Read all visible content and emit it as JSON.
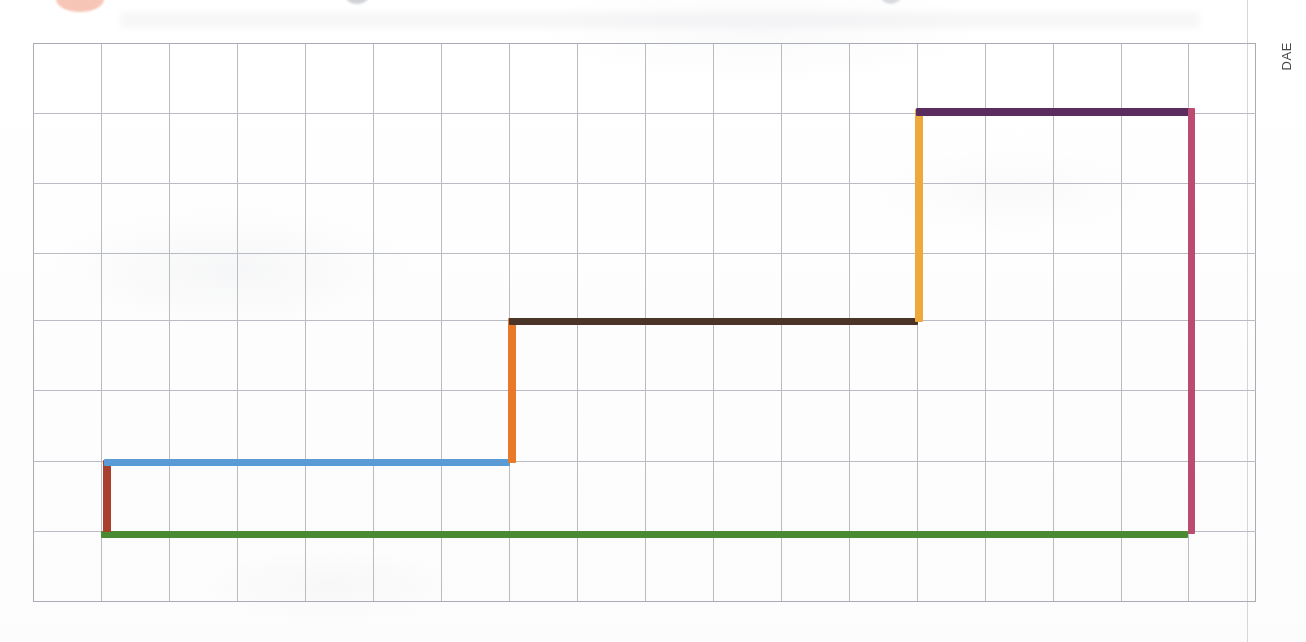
{
  "page": {
    "side_label": "DAE",
    "background_color": "#fefefe",
    "grid_color": "#b9bcc2"
  },
  "chart_data": {
    "type": "line",
    "subtype": "step-chart-hand-drawn",
    "title": "",
    "subtitle": "",
    "xlabel": "",
    "ylabel": "",
    "grid": true,
    "grid_columns": 18,
    "grid_rows": 8,
    "xlim": [
      0,
      18
    ],
    "ylim": [
      0,
      8
    ],
    "legend": "none",
    "annotations": [
      "DAE"
    ],
    "axis_note": "Axes are unlabeled; values are read as grid-square units from the lower-left corner of the printed grid.",
    "series": [
      {
        "name": "baseline",
        "color": "#4A8A33",
        "color_name": "green",
        "orientation": "horizontal",
        "y_units": 1.0,
        "x_start_units": 1.0,
        "x_end_units": 17.0,
        "thickness_px": 7,
        "px": {
          "x1": 101,
          "x2": 1188,
          "y": 531
        }
      },
      {
        "name": "riser-1",
        "color": "#A8402D",
        "color_name": "dark red",
        "orientation": "vertical",
        "x_units": 1.0,
        "y_start_units": 1.0,
        "y_end_units": 2.0,
        "thickness_px": 8,
        "px": {
          "x": 103,
          "y1": 460,
          "y2": 532
        }
      },
      {
        "name": "step-1",
        "color": "#5B9BD5",
        "color_name": "blue",
        "orientation": "horizontal",
        "y_units": 2.0,
        "x_start_units": 1.0,
        "x_end_units": 7.0,
        "thickness_px": 7,
        "px": {
          "x1": 104,
          "x2": 510,
          "y": 459
        }
      },
      {
        "name": "riser-2",
        "color": "#E8792B",
        "color_name": "orange",
        "orientation": "vertical",
        "x_units": 7.0,
        "y_start_units": 2.0,
        "y_end_units": 4.0,
        "thickness_px": 8,
        "px": {
          "x": 508,
          "y1": 318,
          "y2": 463
        }
      },
      {
        "name": "step-2",
        "color": "#4A3528",
        "color_name": "brown",
        "orientation": "horizontal",
        "y_units": 4.0,
        "x_start_units": 7.0,
        "x_end_units": 13.0,
        "thickness_px": 7,
        "px": {
          "x1": 509,
          "x2": 918,
          "y": 318
        }
      },
      {
        "name": "riser-3",
        "color": "#EFA83A",
        "color_name": "amber",
        "orientation": "vertical",
        "x_units": 13.0,
        "y_start_units": 4.0,
        "y_end_units": 7.0,
        "thickness_px": 8,
        "px": {
          "x": 915,
          "y1": 109,
          "y2": 322
        }
      },
      {
        "name": "step-3",
        "color": "#5B2D5E",
        "color_name": "purple",
        "orientation": "horizontal",
        "y_units": 7.0,
        "x_start_units": 13.0,
        "x_end_units": 17.0,
        "thickness_px": 8,
        "px": {
          "x1": 916,
          "x2": 1190,
          "y": 108
        }
      },
      {
        "name": "closing-drop",
        "color": "#BC4B72",
        "color_name": "crimson",
        "orientation": "vertical",
        "x_units": 17.0,
        "y_start_units": 1.0,
        "y_end_units": 7.0,
        "thickness_px": 7,
        "px": {
          "x": 1188,
          "y1": 108,
          "y2": 534
        }
      }
    ],
    "step_levels": [
      {
        "label": "baseline",
        "value_units": 1.0,
        "color": "#4A8A33"
      },
      {
        "label": "step-1",
        "value_units": 2.0,
        "color": "#5B9BD5"
      },
      {
        "label": "step-2",
        "value_units": 4.0,
        "color": "#4A3528"
      },
      {
        "label": "step-3",
        "value_units": 7.0,
        "color": "#5B2D5E"
      }
    ],
    "x_breakpoints_units": [
      1.0,
      7.0,
      13.0,
      17.0
    ]
  }
}
